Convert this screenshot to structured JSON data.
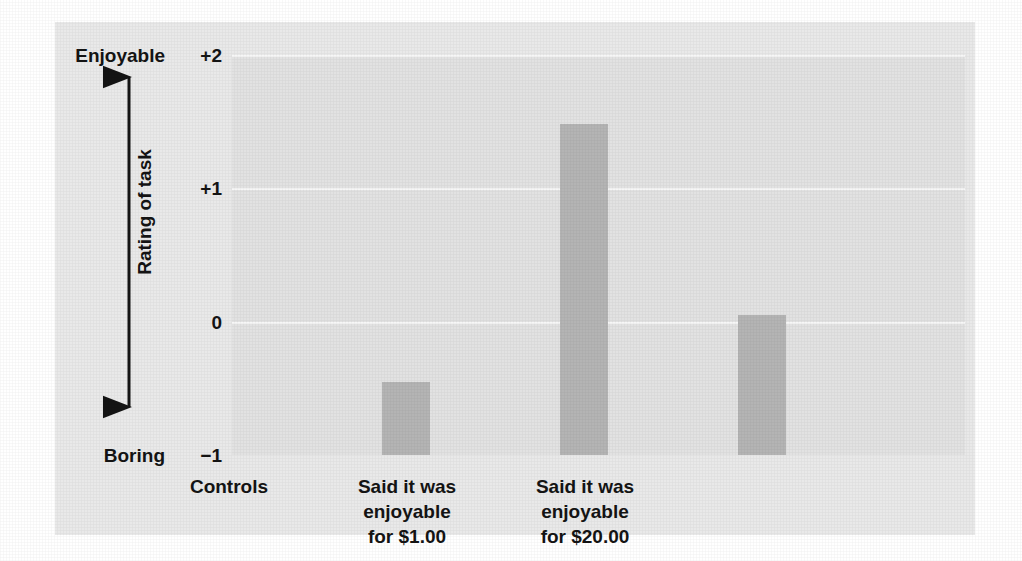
{
  "chart_data": {
    "type": "bar",
    "title": "",
    "subtitle": "",
    "xlabel": "",
    "ylabel": "Rating of task",
    "categories": [
      "Controls",
      "Said it was enjoyable for $1.00",
      "Said it was enjoyable for $20.00"
    ],
    "category_label_lines": [
      [
        "Controls"
      ],
      [
        "Said it was",
        "enjoyable",
        "for $1.00"
      ],
      [
        "Said it was",
        "enjoyable",
        "for $20.00"
      ]
    ],
    "values": [
      -0.45,
      1.48,
      0.05
    ],
    "ylim": [
      -1,
      2
    ],
    "yticks": [
      2,
      1,
      0,
      -1
    ],
    "ytick_labels": [
      "+2",
      "+1",
      "0",
      "−1"
    ],
    "axis_anchor_high": "Enjoyable",
    "axis_anchor_low": "Boring",
    "grid": true,
    "gridline_color": "#f7f7f7",
    "legend": "none",
    "bar_color": "#b4b4b4",
    "plot_background": "#e2e2e2",
    "figure_background": "#e9e9e9",
    "page_background": "#ffffff",
    "text_color": "#141414"
  }
}
